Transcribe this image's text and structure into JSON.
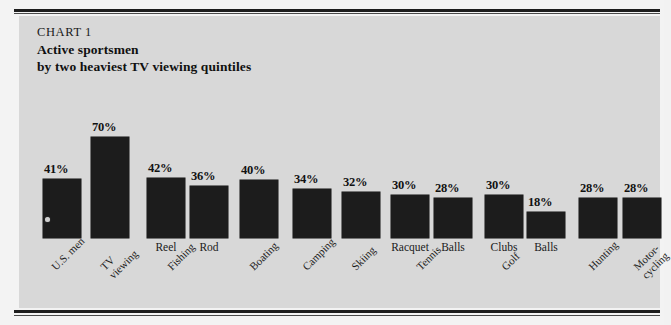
{
  "figure": {
    "kicker": "CHART 1",
    "title_line1": "Active sportsmen",
    "title_line2": "by two heaviest TV viewing quintiles",
    "panel_background": "#d8d8d8",
    "page_background": "#f3f3f3",
    "bar_color": "#1c1c1c"
  },
  "chart_data": {
    "type": "bar",
    "title": "Active sportsmen by two heaviest TV viewing quintiles",
    "subtitle": "CHART 1",
    "xlabel": "",
    "ylabel": "",
    "ylim": [
      0,
      75
    ],
    "grid": false,
    "legend": "none",
    "value_suffix": "%",
    "categories": [
      "U.S. men",
      "TV viewing",
      "Fishing – Reel",
      "Fishing – Rod",
      "Boating",
      "Camping",
      "Skiing",
      "Tennis – Racquet",
      "Tennis – Balls",
      "Golf – Clubs",
      "Golf – Balls",
      "Hunting",
      "Motor-cycling"
    ],
    "values": [
      41,
      70,
      42,
      36,
      40,
      34,
      32,
      30,
      28,
      30,
      18,
      28,
      28
    ],
    "value_labels": [
      "41%",
      "70%",
      "42%",
      "36%",
      "40%",
      "34%",
      "32%",
      "30%",
      "28%",
      "30%",
      "18%",
      "28%",
      "28%"
    ],
    "sub_labels": [
      "",
      "",
      "Reel",
      "Rod",
      "",
      "",
      "",
      "Racquet",
      "Balls",
      "Clubs",
      "Balls",
      "",
      ""
    ],
    "tick_labels": [
      {
        "lines": [
          "U.S. men"
        ]
      },
      {
        "lines": [
          "TV",
          "viewing"
        ]
      },
      {
        "lines": [
          "Fishing"
        ]
      },
      {
        "lines": [
          "Boating"
        ]
      },
      {
        "lines": [
          "Camping"
        ]
      },
      {
        "lines": [
          "Skiing"
        ]
      },
      {
        "lines": [
          "Tennis"
        ]
      },
      {
        "lines": [
          "Golf"
        ]
      },
      {
        "lines": [
          "Hunting"
        ]
      },
      {
        "lines": [
          "Motor-",
          "cycling"
        ]
      }
    ]
  }
}
